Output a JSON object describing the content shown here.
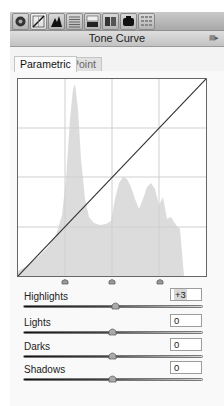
{
  "toolbar": {
    "buttons": [
      {
        "name": "basic-panel-icon",
        "active": false
      },
      {
        "name": "tone-curve-icon",
        "active": true
      },
      {
        "name": "hsl-icon",
        "active": false
      },
      {
        "name": "split-toning-icon",
        "active": false
      },
      {
        "name": "detail-icon",
        "active": false
      },
      {
        "name": "lens-corrections-icon",
        "active": false
      },
      {
        "name": "effects-icon",
        "active": false
      },
      {
        "name": "camera-calibration-icon",
        "active": false
      }
    ]
  },
  "header": {
    "title": "Tone Curve",
    "menu_icon": "panel-menu-icon",
    "menu_glyph": "▤▸"
  },
  "tabs": [
    {
      "label": "Parametric",
      "active": true
    },
    {
      "label": "Point",
      "active": false
    }
  ],
  "graph": {
    "curve": "linear-identity",
    "grid_divisions": 4,
    "split_handles": [
      25,
      50,
      75
    ],
    "histogram_color": "#dcdcdc",
    "grid_color": "#cfcfcf",
    "curve_color": "#333333"
  },
  "sliders": [
    {
      "label": "Highlights",
      "value": "+3",
      "position": 0.515,
      "selected": true
    },
    {
      "label": "Lights",
      "value": "0",
      "position": 0.5,
      "selected": false
    },
    {
      "label": "Darks",
      "value": "0",
      "position": 0.5,
      "selected": false
    },
    {
      "label": "Shadows",
      "value": "0",
      "position": 0.5,
      "selected": false
    }
  ]
}
